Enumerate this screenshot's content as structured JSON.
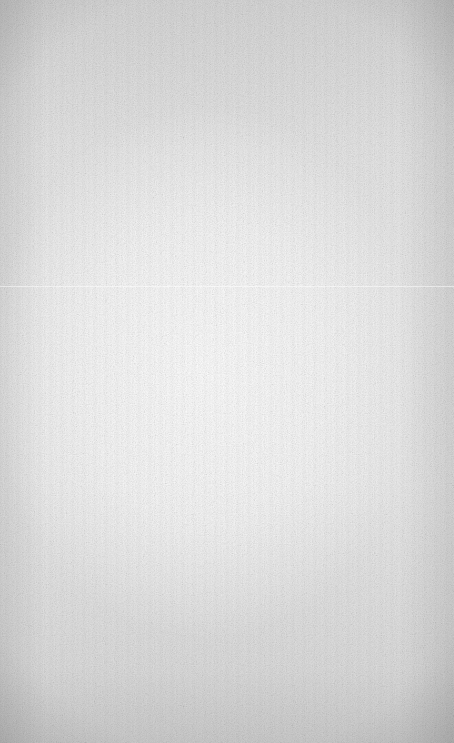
{
  "background": {
    "type": "textured-paper",
    "description": "Blank grey-white grunge texture with darker vignette edges",
    "colors": {
      "center": "#ffffff",
      "mid": "#e8e8e8",
      "edge": "#b5b5b5"
    }
  }
}
